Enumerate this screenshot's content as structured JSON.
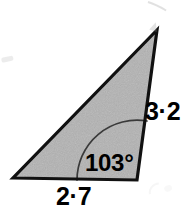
{
  "figure": {
    "kind": "triangle-diagram",
    "background_color": "#ffffff",
    "fill_color": "#b0b0b0",
    "outline_color": "#111111",
    "arc_color": "#3a3a3a",
    "text_color": "#000000",
    "vertices": {
      "bottom_left": {
        "x": 13,
        "y": 178
      },
      "bottom_right": {
        "x": 137,
        "y": 180
      },
      "apex": {
        "x": 157,
        "y": 30
      }
    },
    "angle_arc": {
      "center_x": 137,
      "center_y": 180,
      "radius": 60,
      "start_x": 77,
      "start_y": 180,
      "end_x": 147,
      "end_y": 121
    }
  },
  "labels": {
    "base_length": "2·7",
    "right_side_length": "3·2",
    "angle": "103°"
  },
  "artifacts": [
    {
      "name": "scan-mark-top-right",
      "x": 148,
      "y": 2,
      "width": 14,
      "height": 16,
      "rotate": -28,
      "opacity": 0.3
    },
    {
      "name": "scan-mark-top-right-lower",
      "x": 152,
      "y": 21,
      "width": 8,
      "height": 9,
      "rotate": 18,
      "opacity": 0.28
    },
    {
      "name": "scan-mark-left-edge",
      "x": 1,
      "y": 58,
      "width": 12,
      "height": 6,
      "rotate": -12,
      "opacity": 0.26
    },
    {
      "name": "scan-mark-bottom-right",
      "x": 150,
      "y": 182,
      "width": 13,
      "height": 13,
      "rotate": 10,
      "opacity": 0.14
    },
    {
      "name": "scan-mark-bottom-right-b",
      "x": 163,
      "y": 186,
      "width": 9,
      "height": 8,
      "rotate": -20,
      "opacity": 0.11
    }
  ]
}
